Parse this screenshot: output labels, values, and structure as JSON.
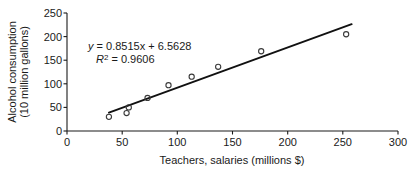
{
  "chart_data": {
    "type": "scatter",
    "title": "",
    "xlabel": "Teachers, salaries (millions $)",
    "ylabel_line1": "Alcohol consumption",
    "ylabel_line2": "(10 million gallons)",
    "xlim": [
      0,
      300
    ],
    "ylim": [
      0,
      250
    ],
    "xticks": [
      0,
      50,
      100,
      150,
      200,
      250,
      300
    ],
    "yticks": [
      0,
      50,
      100,
      150,
      200,
      250
    ],
    "xtick_labels": [
      "0",
      "50",
      "100",
      "150",
      "200",
      "250",
      "300"
    ],
    "ytick_labels": [
      "0",
      "50",
      "100",
      "150",
      "200",
      "250"
    ],
    "grid": false,
    "legend": false,
    "marker_style": "open-circle",
    "points": [
      {
        "x": 38,
        "y": 30
      },
      {
        "x": 54,
        "y": 38
      },
      {
        "x": 56,
        "y": 50
      },
      {
        "x": 73,
        "y": 70
      },
      {
        "x": 92,
        "y": 97
      },
      {
        "x": 113,
        "y": 115
      },
      {
        "x": 137,
        "y": 136
      },
      {
        "x": 176,
        "y": 169
      },
      {
        "x": 253,
        "y": 205
      }
    ],
    "trendline": {
      "slope": 0.8515,
      "intercept": 6.5628,
      "x_start": 38,
      "x_end": 258,
      "r_squared": 0.9606
    },
    "annotations": {
      "equation": "y = 0.8515x + 6.5628",
      "equation_y": "y",
      "equation_rest": " = 0.8515x + 6.5628",
      "r_squared_label": "R",
      "r_squared_sup": "2",
      "r_squared_value": " = 0.9606"
    }
  },
  "axis_labels": {
    "x_title": "Teachers, salaries (millions $)",
    "y_title_line1": "Alcohol consumption",
    "y_title_line2": "(10 million gallons)"
  },
  "ticks": {
    "x": [
      "0",
      "50",
      "100",
      "150",
      "200",
      "250",
      "300"
    ],
    "y": [
      "0",
      "50",
      "100",
      "150",
      "200",
      "250"
    ]
  },
  "annotation_text": {
    "equation_var": "y",
    "equation_body": " = 0.8515x + 6.5628",
    "r_var": "R",
    "r_exp": "2",
    "r_body": " = 0.9606"
  },
  "colors": {
    "axis": "#1a1a1a",
    "trendline": "#111111",
    "marker_stroke": "#3a3a3a",
    "background": "#ffffff"
  }
}
